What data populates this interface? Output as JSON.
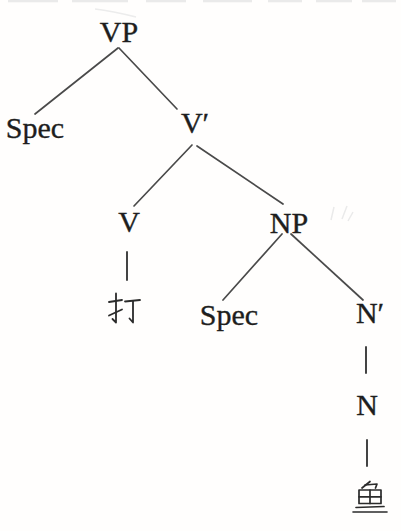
{
  "figure": {
    "type": "syntax-tree",
    "colors": {
      "background": "#fffefd",
      "text": "#1e1e1e",
      "line": "#4a4a4a"
    },
    "nodes": [
      {
        "id": "vp",
        "label": "VP"
      },
      {
        "id": "spec-of-vp",
        "label": "Spec"
      },
      {
        "id": "v-bar",
        "label": "V′"
      },
      {
        "id": "v",
        "label": "V"
      },
      {
        "id": "np",
        "label": "NP"
      },
      {
        "id": "v-terminal",
        "label": "打",
        "underlined": false
      },
      {
        "id": "spec-of-np",
        "label": "Spec"
      },
      {
        "id": "n-bar",
        "label": "N′"
      },
      {
        "id": "n",
        "label": "N"
      },
      {
        "id": "n-terminal",
        "label": "鱼",
        "underlined": true
      }
    ],
    "edges": [
      {
        "from": "VP",
        "to": "Spec"
      },
      {
        "from": "VP",
        "to": "V′"
      },
      {
        "from": "V′",
        "to": "V"
      },
      {
        "from": "V′",
        "to": "NP"
      },
      {
        "from": "V",
        "to": "打"
      },
      {
        "from": "NP",
        "to": "Spec"
      },
      {
        "from": "NP",
        "to": "N′"
      },
      {
        "from": "N′",
        "to": "N"
      },
      {
        "from": "N",
        "to": "鱼"
      }
    ]
  }
}
